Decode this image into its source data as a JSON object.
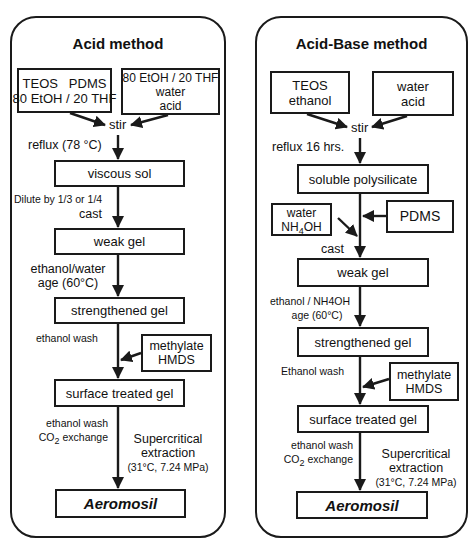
{
  "acid": {
    "title": "Acid method",
    "box_inputs_1": [
      "TEOS   PDMS",
      "80 EtOH / 20 THF"
    ],
    "box_inputs_2": [
      "80 EtOH / 20 THF",
      "water",
      "acid"
    ],
    "stir": "stir",
    "reflux": "reflux (78 °C)",
    "viscous_sol": "viscous sol",
    "dilute": "Dilute by 1/3 or 1/4",
    "cast": "cast",
    "weak_gel": "weak gel",
    "age_1": "ethanol/water",
    "age_2": "age (60°C)",
    "strengthened_gel": "strengthened gel",
    "ethanol_wash": "ethanol wash",
    "methylate": [
      "methylate",
      "HMDS"
    ],
    "surface_treated_gel": "surface treated gel",
    "wash2_1": "ethanol wash",
    "wash2_2_prefix": "CO",
    "wash2_2_sub": "2",
    "wash2_2_suffix": " exchange",
    "sc_1": "Supercritical",
    "sc_2": "extraction",
    "sc_3": "(31°C, 7.24 MPa)",
    "final": "Aeromosil"
  },
  "acid_base": {
    "title": "Acid-Base method",
    "box_inputs_1": [
      "TEOS",
      "ethanol"
    ],
    "box_inputs_2": [
      "water",
      "acid"
    ],
    "stir": "stir",
    "reflux": "reflux 16 hrs.",
    "soluble_polysilicate": "soluble polysilicate",
    "water_box_1": "water",
    "water_box_2_prefix": "NH",
    "water_box_2_sub": "4",
    "water_box_2_suffix": "OH",
    "pdms": "PDMS",
    "cast": "cast",
    "weak_gel": "weak gel",
    "age_1": "ethanol / NH4OH",
    "age_2": "age (60°C)",
    "strengthened_gel": "strengthened gel",
    "ethanol_wash": "Ethanol wash",
    "methylate": [
      "methylate",
      "HMDS"
    ],
    "surface_treated_gel": "surface treated gel",
    "wash2_1": "ethanol wash",
    "wash2_2_prefix": "CO",
    "wash2_2_sub": "2",
    "wash2_2_suffix": " exchange",
    "sc_1": "Supercritical",
    "sc_2": "extraction",
    "sc_3": "(31°C, 7.24 MPa)",
    "final": "Aeromosil"
  },
  "colors": {
    "line": "#1a1a1a",
    "background": "#ffffff"
  }
}
